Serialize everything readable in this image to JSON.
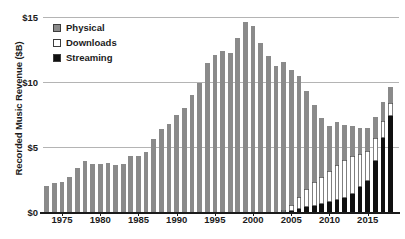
{
  "chart_data": {
    "type": "bar",
    "subtype": "stacked-bar",
    "title": "",
    "xlabel": "",
    "ylabel": "Recorded Music Revenue ($B)",
    "ylim": [
      0,
      15
    ],
    "ytick_labels": [
      "$0",
      "$5",
      "$10",
      "$15"
    ],
    "ytick_values": [
      0,
      5,
      10,
      15
    ],
    "xtick_labels": [
      "1975",
      "1980",
      "1985",
      "1990",
      "1995",
      "2000",
      "2005",
      "2010",
      "2015"
    ],
    "xtick_values": [
      1975,
      1980,
      1985,
      1990,
      1995,
      2000,
      2005,
      2010,
      2015
    ],
    "grid": true,
    "legend_position": "top-left",
    "legend": [
      "Physical",
      "Downloads",
      "Streaming"
    ],
    "colors": {
      "physical": "#8a8a8a",
      "downloads": "#ffffff",
      "streaming": "#101010",
      "gridline": "#b4b4b4",
      "axis": "#1b1b1b",
      "background": "#ffffff"
    },
    "categories": [
      1973,
      1974,
      1975,
      1976,
      1977,
      1978,
      1979,
      1980,
      1981,
      1982,
      1983,
      1984,
      1985,
      1986,
      1987,
      1988,
      1989,
      1990,
      1991,
      1992,
      1993,
      1994,
      1995,
      1996,
      1997,
      1998,
      1999,
      2000,
      2001,
      2002,
      2003,
      2004,
      2005,
      2006,
      2007,
      2008,
      2009,
      2010,
      2011,
      2012,
      2013,
      2014,
      2015,
      2016,
      2017,
      2018
    ],
    "series": [
      {
        "name": "Physical",
        "values": [
          2.0,
          2.2,
          2.3,
          2.7,
          3.4,
          3.9,
          3.7,
          3.7,
          3.8,
          3.6,
          3.7,
          4.3,
          4.3,
          4.6,
          5.6,
          6.4,
          6.8,
          7.5,
          8.0,
          9.0,
          9.9,
          11.5,
          12.1,
          12.4,
          12.2,
          13.4,
          14.6,
          14.3,
          13.0,
          12.0,
          11.2,
          11.4,
          10.4,
          9.3,
          7.5,
          5.9,
          4.5,
          3.5,
          3.3,
          2.7,
          2.3,
          2.0,
          1.8,
          1.6,
          1.5,
          1.2
        ]
      },
      {
        "name": "Downloads",
        "values": [
          0,
          0,
          0,
          0,
          0,
          0,
          0,
          0,
          0,
          0,
          0,
          0,
          0,
          0,
          0,
          0,
          0,
          0,
          0,
          0,
          0,
          0,
          0,
          0,
          0,
          0,
          0,
          0,
          0,
          0,
          0,
          0.15,
          0.45,
          0.9,
          1.4,
          1.8,
          2.1,
          2.4,
          2.7,
          2.9,
          2.9,
          2.6,
          2.3,
          1.8,
          1.3,
          1.0
        ]
      },
      {
        "name": "Streaming",
        "values": [
          0,
          0,
          0,
          0,
          0,
          0,
          0,
          0,
          0,
          0,
          0,
          0,
          0,
          0,
          0,
          0,
          0,
          0,
          0,
          0,
          0,
          0,
          0,
          0,
          0,
          0,
          0,
          0,
          0,
          0,
          0,
          0,
          0.1,
          0.25,
          0.4,
          0.5,
          0.6,
          0.75,
          0.9,
          1.1,
          1.4,
          1.9,
          2.4,
          3.9,
          5.7,
          7.4
        ]
      }
    ],
    "totals": [
      2.0,
      2.2,
      2.3,
      2.7,
      3.4,
      3.9,
      3.7,
      3.7,
      3.8,
      3.6,
      3.7,
      4.3,
      4.3,
      4.6,
      5.6,
      6.4,
      6.8,
      7.5,
      8.0,
      9.0,
      9.9,
      11.5,
      12.1,
      12.4,
      12.2,
      13.4,
      14.6,
      14.3,
      13.0,
      12.0,
      11.2,
      11.55,
      10.95,
      10.45,
      9.3,
      8.2,
      7.2,
      6.65,
      6.9,
      6.7,
      6.6,
      6.5,
      6.5,
      7.3,
      8.5,
      9.6
    ]
  }
}
